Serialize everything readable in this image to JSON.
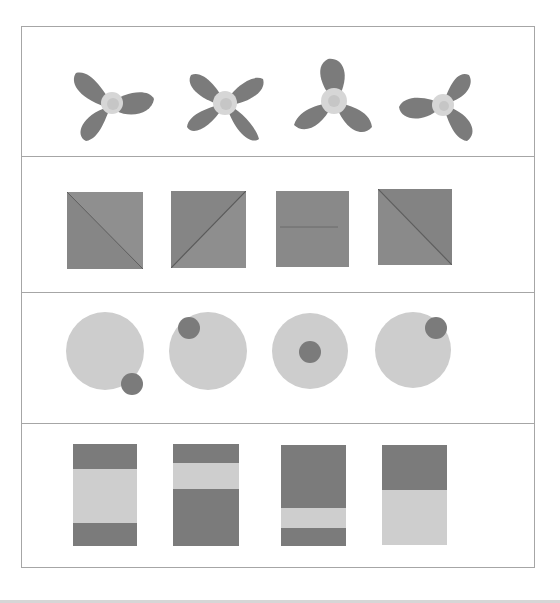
{
  "colors": {
    "frame": "#a6a6a6",
    "dark": "#7b7b7b",
    "light": "#cfcfcf",
    "center": "#d9d9d9",
    "background": "#ffffff"
  },
  "rows": [
    {
      "name": "flowers",
      "items": [
        {
          "petals": 3,
          "rotation": 0
        },
        {
          "petals": 4,
          "rotation": 0
        },
        {
          "petals": 3,
          "rotation": 180
        },
        {
          "petals": 3,
          "rotation": 210
        }
      ]
    },
    {
      "name": "squares",
      "items": [
        {
          "line": "diagonal-tl-br"
        },
        {
          "line": "diagonal-bl-tr"
        },
        {
          "line": "horizontal"
        },
        {
          "line": "diagonal-tl-br"
        }
      ]
    },
    {
      "name": "circles",
      "items": [
        {
          "dot": "bottom-right"
        },
        {
          "dot": "top-left"
        },
        {
          "dot": "center"
        },
        {
          "dot": "top-right"
        }
      ]
    },
    {
      "name": "bars",
      "items": [
        {
          "bands": [
            "dark",
            "light",
            "dark"
          ]
        },
        {
          "bands": [
            "dark",
            "light",
            "dark"
          ]
        },
        {
          "bands": [
            "dark",
            "light",
            "dark"
          ]
        },
        {
          "bands": [
            "dark",
            "light"
          ]
        }
      ]
    }
  ]
}
